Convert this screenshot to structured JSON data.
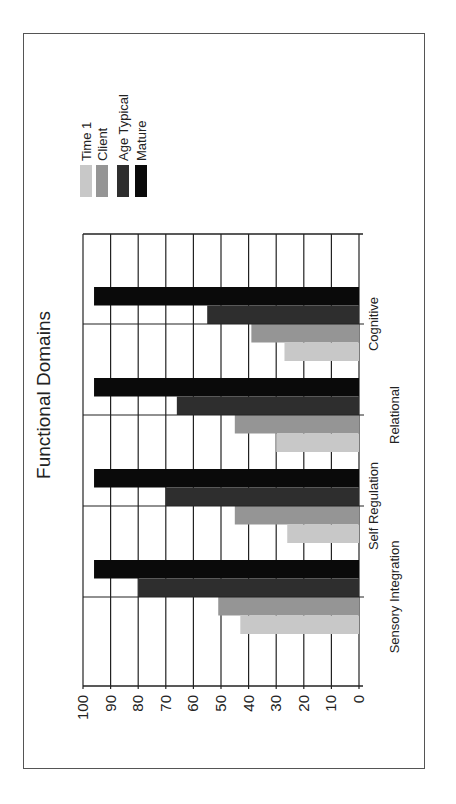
{
  "chart_data": {
    "type": "bar",
    "orientation": "vertical bars, figure rotated 90° counter-clockwise",
    "title": "Functional Domains",
    "xlabel": "",
    "ylabel": "",
    "categories": [
      "Sensory Integration",
      "Self Regulation",
      "Relational",
      "Cognitive"
    ],
    "series": [
      {
        "name": "Time 1",
        "color": "#c8c8c8",
        "values": [
          43,
          26,
          30,
          27
        ]
      },
      {
        "name": "Client",
        "color": "#959595",
        "values": [
          51,
          45,
          45,
          39
        ]
      },
      {
        "name": "Age Typical",
        "color": "#2e2e2e",
        "values": [
          80,
          70,
          66,
          55
        ]
      },
      {
        "name": "Mature",
        "color": "#0a0a0a",
        "values": [
          96,
          96,
          96,
          96
        ]
      }
    ],
    "ylim": [
      0,
      100
    ],
    "yticks": [
      0,
      10,
      20,
      30,
      40,
      50,
      60,
      70,
      80,
      90,
      100
    ],
    "grid": true,
    "legend_position": "right"
  },
  "legend": {
    "items": [
      {
        "label": "Time 1",
        "color": "#c8c8c8"
      },
      {
        "label": "Client",
        "color": "#959595"
      },
      {
        "label": "Age Typical",
        "color": "#2e2e2e"
      },
      {
        "label": "Mature",
        "color": "#0a0a0a"
      }
    ]
  }
}
